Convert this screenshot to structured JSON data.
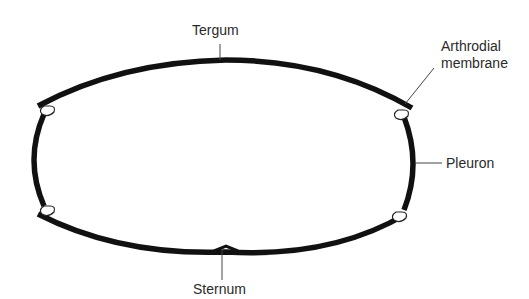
{
  "diagram": {
    "labels": {
      "tergum": "Tergum",
      "arthrodial_line1": "Arthrodial",
      "arthrodial_line2": "membrane",
      "pleuron": "Pleuron",
      "sternum": "Sternum"
    },
    "colors": {
      "plate": "#111111",
      "membrane_fill": "#ffffff",
      "text": "#2a2a2a",
      "background": "#ffffff"
    }
  }
}
